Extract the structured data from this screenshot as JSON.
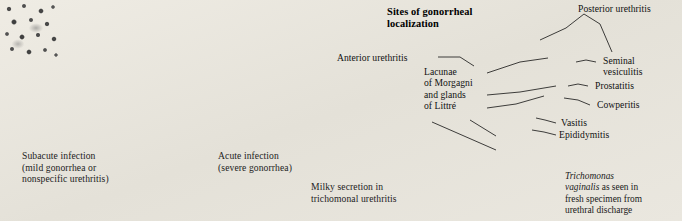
{
  "plate": {
    "background_color": "#fdfdfc",
    "ink_color": "#111111"
  },
  "diagram_title": "Sites of gonorrheal\nlocalization",
  "photo_captions": [
    {
      "name": "subacute-infection",
      "text": "Subacute infection\n(mild gonorrhea or\nnonspecific urethritis)"
    },
    {
      "name": "acute-infection",
      "text": "Acute infection\n(severe gonorrhea)"
    },
    {
      "name": "milky-secretion",
      "text": "Milky secretion in\ntrichomonal urethritis"
    }
  ],
  "anatomy_labels": [
    {
      "name": "anterior-urethritis",
      "text": "Anterior urethritis"
    },
    {
      "name": "posterior-urethritis",
      "text": "Posterior urethritis"
    },
    {
      "name": "lacunae-of-morgagni",
      "text": "Lacunae\nof Morgagni\nand glands\nof Littré"
    },
    {
      "name": "seminal-vesiculitis",
      "text": "Seminal\nvesiculitis"
    },
    {
      "name": "prostatitis",
      "text": "Prostatitis"
    },
    {
      "name": "cowperitis",
      "text": "Cowperitis"
    },
    {
      "name": "vasitis",
      "text": "Vasitis"
    },
    {
      "name": "epididymitis",
      "text": "Epididymitis"
    }
  ],
  "micrograph_caption": {
    "species": "Trichomonas\nvaginalis",
    "rest": " as seen in\nfresh specimen from\nurethral discharge"
  }
}
